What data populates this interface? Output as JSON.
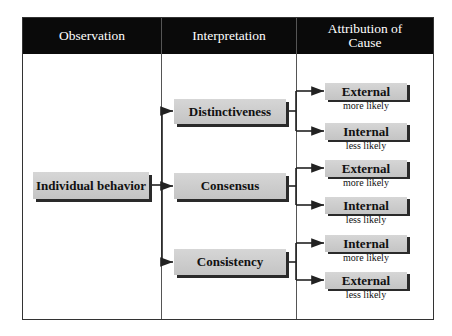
{
  "headers": [
    "Observation",
    "Interpretation",
    "Attribution of Cause"
  ],
  "observation": "Individual behavior",
  "interpretations": [
    "Distinctiveness",
    "Consensus",
    "Consistency"
  ],
  "attributions": [
    {
      "label": "External",
      "likelihood": "more likely"
    },
    {
      "label": "Internal",
      "likelihood": "less likely"
    },
    {
      "label": "External",
      "likelihood": "more likely"
    },
    {
      "label": "Internal",
      "likelihood": "less likely"
    },
    {
      "label": "Internal",
      "likelihood": "more likely"
    },
    {
      "label": "External",
      "likelihood": "less likely"
    }
  ]
}
